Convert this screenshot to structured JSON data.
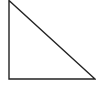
{
  "diagram": {
    "shape": "right-triangle",
    "stroke_color": "#222222",
    "fill_color": "#ffffff",
    "stroke_width": 1.4,
    "vertices": [
      {
        "name": "top",
        "x": 9,
        "y": 0.5
      },
      {
        "name": "bottom-left-right-angle",
        "x": 9,
        "y": 79
      },
      {
        "name": "bottom-right",
        "x": 95,
        "y": 79
      }
    ]
  }
}
